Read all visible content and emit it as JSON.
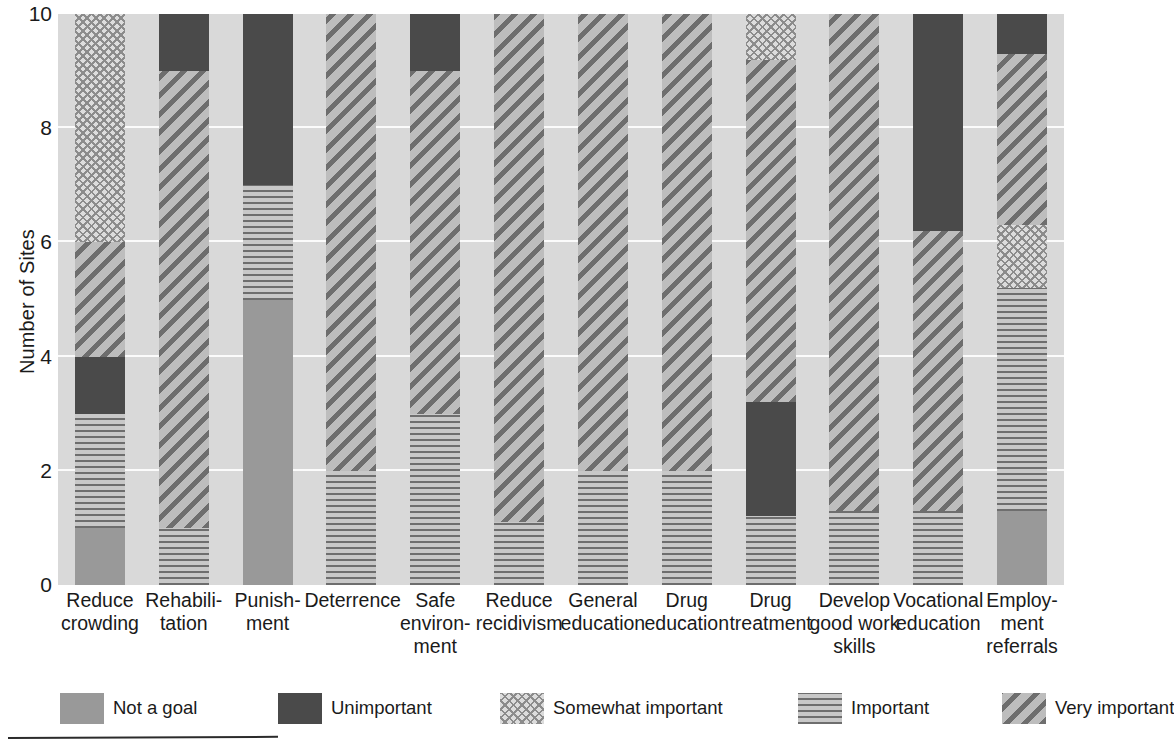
{
  "chart_data": {
    "type": "bar",
    "stacked": true,
    "title": "",
    "subtitle": "",
    "xlabel": "",
    "ylabel": "Number of Sites",
    "ylim": [
      0,
      10
    ],
    "yticks": [
      0,
      2,
      4,
      6,
      8,
      10
    ],
    "ytick_labels": [
      "0",
      "2",
      "4",
      "6",
      "8",
      "10"
    ],
    "grid": true,
    "grid_axis": "y",
    "legend_position": "bottom",
    "categories": [
      "Reduce crowding",
      "Rehabilitation",
      "Punishment",
      "Deterrence",
      "Safe environment",
      "Reduce recidivism",
      "General education",
      "Drug education",
      "Drug treatment",
      "Develop good work skills",
      "Vocational education",
      "Employment referrals"
    ],
    "category_label_lines": [
      [
        "Reduce",
        "crowding"
      ],
      [
        "Rehabili-",
        "tation"
      ],
      [
        "Punish-",
        "ment"
      ],
      [
        "Deterrence"
      ],
      [
        "Safe",
        "environ-",
        "ment"
      ],
      [
        "Reduce",
        "recidivism"
      ],
      [
        "General",
        "education"
      ],
      [
        "Drug",
        "education"
      ],
      [
        "Drug",
        "treatment"
      ],
      [
        "Develop",
        "good work",
        "skills"
      ],
      [
        "Vocational",
        "education"
      ],
      [
        "Employ-",
        "ment",
        "referrals"
      ]
    ],
    "series": [
      {
        "name": "Not a goal",
        "pattern": "solid-gray",
        "color": "#999999",
        "values": [
          1,
          0,
          5,
          0,
          0,
          0,
          0,
          0,
          0,
          0,
          0,
          1.3
        ]
      },
      {
        "name": "Important",
        "pattern": "horizontal-lines",
        "color": "#6e6e6e",
        "values": [
          2,
          1,
          2,
          2,
          3,
          1.1,
          2,
          2,
          1.2,
          1.3,
          1.3,
          3.9
        ]
      },
      {
        "name": "Unimportant",
        "pattern": "solid-dark",
        "color": "#4a4a4a",
        "values": [
          1,
          0,
          3,
          0,
          0,
          0,
          0,
          0,
          2,
          0,
          0,
          0
        ]
      },
      {
        "name": "Very important",
        "pattern": "diagonal-stripes",
        "color": "#6e6e6e",
        "values": [
          2,
          8,
          0,
          8,
          6,
          8.9,
          8,
          8,
          6,
          8.7,
          4.9,
          3
        ]
      },
      {
        "name": "Somewhat important",
        "pattern": "crosshatch",
        "color": "#8c8c8c",
        "values": [
          4,
          0,
          0,
          0,
          0,
          0,
          0,
          0,
          0.8,
          0,
          0,
          1.1
        ]
      },
      {
        "name": "Unimportant (top)",
        "pattern": "solid-dark",
        "color": "#4a4a4a",
        "values": [
          0,
          1,
          0,
          0,
          1,
          0,
          0,
          0,
          0,
          0,
          3.8,
          0.7
        ]
      }
    ],
    "bars": [
      {
        "category": "Reduce crowding",
        "total": 10,
        "segments": [
          {
            "label": "Not a goal",
            "from": 0,
            "to": 1,
            "pattern": "notgoal"
          },
          {
            "label": "Important",
            "from": 1,
            "to": 3,
            "pattern": "important"
          },
          {
            "label": "Unimportant",
            "from": 3,
            "to": 4,
            "pattern": "unimp"
          },
          {
            "label": "Very important",
            "from": 4,
            "to": 6,
            "pattern": "very"
          },
          {
            "label": "Somewhat important",
            "from": 6,
            "to": 10,
            "pattern": "somewhat"
          }
        ]
      },
      {
        "category": "Rehabilitation",
        "total": 10,
        "segments": [
          {
            "label": "Important",
            "from": 0,
            "to": 1,
            "pattern": "important"
          },
          {
            "label": "Very important",
            "from": 1,
            "to": 9,
            "pattern": "very"
          },
          {
            "label": "Unimportant",
            "from": 9,
            "to": 10,
            "pattern": "unimp"
          }
        ]
      },
      {
        "category": "Punishment",
        "total": 10,
        "segments": [
          {
            "label": "Not a goal",
            "from": 0,
            "to": 5,
            "pattern": "notgoal"
          },
          {
            "label": "Important",
            "from": 5,
            "to": 7,
            "pattern": "important"
          },
          {
            "label": "Unimportant",
            "from": 7,
            "to": 10,
            "pattern": "unimp"
          }
        ]
      },
      {
        "category": "Deterrence",
        "total": 10,
        "segments": [
          {
            "label": "Important",
            "from": 0,
            "to": 2,
            "pattern": "important"
          },
          {
            "label": "Very important",
            "from": 2,
            "to": 10,
            "pattern": "very"
          }
        ]
      },
      {
        "category": "Safe environment",
        "total": 10,
        "segments": [
          {
            "label": "Important",
            "from": 0,
            "to": 3,
            "pattern": "important"
          },
          {
            "label": "Very important",
            "from": 3,
            "to": 9,
            "pattern": "very"
          },
          {
            "label": "Unimportant",
            "from": 9,
            "to": 10,
            "pattern": "unimp"
          }
        ]
      },
      {
        "category": "Reduce recidivism",
        "total": 10,
        "segments": [
          {
            "label": "Important",
            "from": 0,
            "to": 1.1,
            "pattern": "important"
          },
          {
            "label": "Very important",
            "from": 1.1,
            "to": 10,
            "pattern": "very"
          }
        ]
      },
      {
        "category": "General education",
        "total": 10,
        "segments": [
          {
            "label": "Important",
            "from": 0,
            "to": 2,
            "pattern": "important"
          },
          {
            "label": "Very important",
            "from": 2,
            "to": 10,
            "pattern": "very"
          }
        ]
      },
      {
        "category": "Drug education",
        "total": 10,
        "segments": [
          {
            "label": "Important",
            "from": 0,
            "to": 2,
            "pattern": "important"
          },
          {
            "label": "Very important",
            "from": 2,
            "to": 10,
            "pattern": "very"
          }
        ]
      },
      {
        "category": "Drug treatment",
        "total": 10,
        "segments": [
          {
            "label": "Important",
            "from": 0,
            "to": 1.2,
            "pattern": "important"
          },
          {
            "label": "Unimportant",
            "from": 1.2,
            "to": 3.2,
            "pattern": "unimp"
          },
          {
            "label": "Very important",
            "from": 3.2,
            "to": 9.2,
            "pattern": "very"
          },
          {
            "label": "Somewhat important",
            "from": 9.2,
            "to": 10,
            "pattern": "somewhat"
          }
        ]
      },
      {
        "category": "Develop good work skills",
        "total": 10,
        "segments": [
          {
            "label": "Important",
            "from": 0,
            "to": 1.3,
            "pattern": "important"
          },
          {
            "label": "Very important",
            "from": 1.3,
            "to": 10,
            "pattern": "very"
          }
        ]
      },
      {
        "category": "Vocational education",
        "total": 10,
        "segments": [
          {
            "label": "Important",
            "from": 0,
            "to": 1.3,
            "pattern": "important"
          },
          {
            "label": "Very important",
            "from": 1.3,
            "to": 6.2,
            "pattern": "very"
          },
          {
            "label": "Unimportant",
            "from": 6.2,
            "to": 10,
            "pattern": "unimp"
          }
        ]
      },
      {
        "category": "Employment referrals",
        "total": 10,
        "segments": [
          {
            "label": "Not a goal",
            "from": 0,
            "to": 1.3,
            "pattern": "notgoal"
          },
          {
            "label": "Important",
            "from": 1.3,
            "to": 5.2,
            "pattern": "important"
          },
          {
            "label": "Somewhat important",
            "from": 5.2,
            "to": 6.3,
            "pattern": "somewhat"
          },
          {
            "label": "Very important",
            "from": 6.3,
            "to": 9.3,
            "pattern": "very"
          },
          {
            "label": "Unimportant",
            "from": 9.3,
            "to": 10,
            "pattern": "unimp"
          }
        ]
      }
    ],
    "legend": [
      {
        "label": "Not a goal",
        "pattern": "notgoal"
      },
      {
        "label": "Unimportant",
        "pattern": "unimp"
      },
      {
        "label": "Somewhat important",
        "pattern": "somewhat"
      },
      {
        "label": "Important",
        "pattern": "important"
      },
      {
        "label": "Very important",
        "pattern": "very"
      }
    ],
    "colors": {
      "plot_background": "#d9d9d9",
      "gridline": "#fbfbfb",
      "not_a_goal": "#999999",
      "unimportant": "#4a4a4a",
      "somewhat_important": "#8c8c8c",
      "important": "#6e6e6e",
      "very_important": "#6e6e6e",
      "text": "#1a1a1a",
      "rule": "#2b2b2b"
    }
  }
}
